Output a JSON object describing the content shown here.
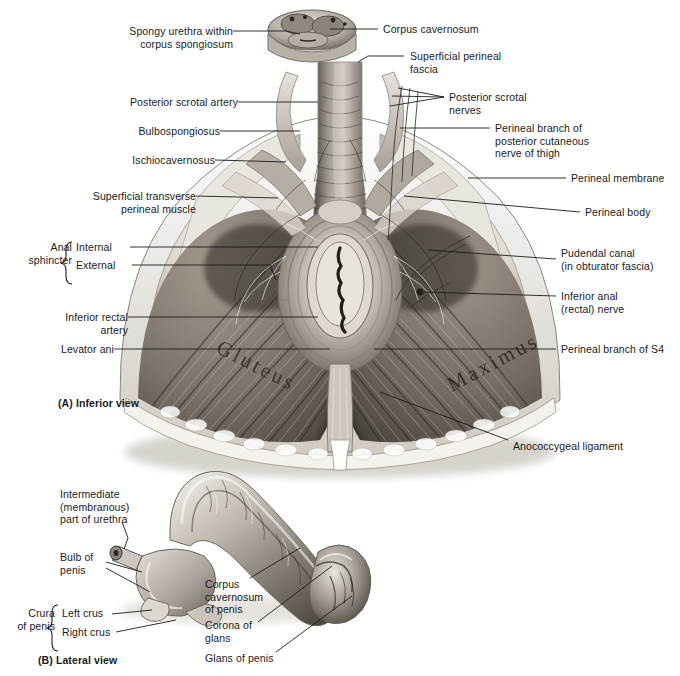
{
  "figure": {
    "panels": [
      {
        "id": "A",
        "caption": "(A) Inferior view"
      },
      {
        "id": "B",
        "caption": "(B) Lateral view"
      }
    ]
  },
  "panelA": {
    "caption": "(A) Inferior view",
    "muscle_text": {
      "gluteus": "Gluteus",
      "maximus": "Maximus"
    },
    "labels_left": [
      {
        "name": "spongy-urethra",
        "line1": "Spongy urethra within",
        "line2": "corpus spongiosum"
      },
      {
        "name": "posterior-scrotal-artery",
        "line1": "Posterior scrotal artery"
      },
      {
        "name": "bulbospongiosus",
        "line1": "Bulbospongiosus"
      },
      {
        "name": "ischiocavernosus",
        "line1": "Ischiocavernosus"
      },
      {
        "name": "superficial-transverse-perineal-muscle",
        "line1": "Superficial transverse",
        "line2": "perineal muscle"
      },
      {
        "name": "inferior-rectal-artery",
        "line1": "Inferior rectal",
        "line2": "artery"
      },
      {
        "name": "levator-ani",
        "line1": "Levator ani"
      }
    ],
    "anal_sphincter": {
      "group_line1": "Anal",
      "group_line2": "sphincter",
      "items": [
        {
          "name": "internal",
          "label": "Internal"
        },
        {
          "name": "external",
          "label": "External"
        }
      ]
    },
    "labels_right": [
      {
        "name": "corpus-cavernosum",
        "line1": "Corpus cavernosum"
      },
      {
        "name": "superficial-perineal-fascia",
        "line1": "Superficial perineal",
        "line2": "fascia"
      },
      {
        "name": "posterior-scrotal-nerves",
        "line1": "Posterior scrotal",
        "line2": "nerves"
      },
      {
        "name": "perineal-branch-posterior-cutaneous-nerve-thigh",
        "line1": "Perineal branch of",
        "line2": "posterior cutaneous",
        "line3": "nerve of thigh"
      },
      {
        "name": "perineal-membrane",
        "line1": "Perineal membrane"
      },
      {
        "name": "perineal-body",
        "line1": "Perineal body"
      },
      {
        "name": "pudendal-canal",
        "line1": "Pudendal canal",
        "line2": "(in obturator fascia)"
      },
      {
        "name": "inferior-anal-rectal-nerve",
        "line1": "Inferior anal",
        "line2": "(rectal) nerve"
      },
      {
        "name": "perineal-branch-of-s4",
        "line1": "Perineal branch of S4"
      },
      {
        "name": "anococcygeal-ligament",
        "line1": "Anococcygeal ligament"
      }
    ]
  },
  "panelB": {
    "caption": "(B) Lateral view",
    "labels_left": [
      {
        "name": "intermediate-membranous-part-of-urethra",
        "line1": "Intermediate",
        "line2": "(membranous)",
        "line3": "part of urethra"
      },
      {
        "name": "bulb-of-penis",
        "line1": "Bulb of",
        "line2": "penis"
      }
    ],
    "crura": {
      "group_line1": "Crura",
      "group_line2": "of penis",
      "items": [
        {
          "name": "left-crus",
          "label": "Left crus"
        },
        {
          "name": "right-crus",
          "label": "Right crus"
        }
      ]
    },
    "labels_right": [
      {
        "name": "corpus-cavernosum-of-penis",
        "line1": "Corpus",
        "line2": "cavernosum",
        "line3": "of penis"
      },
      {
        "name": "corona-of-glans",
        "line1": "Corona of",
        "line2": "glans"
      },
      {
        "name": "glans-of-penis",
        "line1": "Glans of penis"
      }
    ]
  },
  "colors": {
    "background": "#ffffff",
    "ink": "#1a1a1a",
    "leader": "#1c1c1c",
    "tissue_light": "#e8e4de",
    "tissue_mid": "#b3aca4",
    "tissue_dark": "#6d6861",
    "tissue_deep": "#3a3631"
  }
}
